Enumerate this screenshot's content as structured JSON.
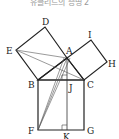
{
  "title": "유클리드의 증명 2",
  "diagram": {
    "points": {
      "A": [
        67,
        58
      ],
      "B": [
        38,
        80
      ],
      "C": [
        84,
        80
      ],
      "D": [
        45,
        27
      ],
      "E": [
        16,
        50
      ],
      "I": [
        91,
        40
      ],
      "H": [
        107,
        62
      ],
      "F": [
        38,
        130
      ],
      "G": [
        84,
        130
      ],
      "J": [
        67,
        80
      ],
      "K": [
        67,
        130
      ]
    },
    "labels": {
      "D": "D",
      "E": "E",
      "A": "A",
      "I": "I",
      "H": "H",
      "B": "B",
      "C": "C",
      "J": "J",
      "F": "F",
      "G": "G",
      "K": "K"
    },
    "stroke_color": "#222222",
    "thin_color": "#555555"
  }
}
